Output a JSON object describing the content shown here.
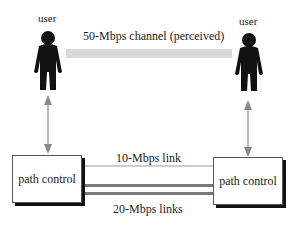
{
  "diagram": {
    "users": [
      {
        "label": "user"
      },
      {
        "label": "user"
      }
    ],
    "perceived_channel": {
      "label": "50-Mbps channel (perceived)",
      "color": "#d9d9d9"
    },
    "path_controls": [
      {
        "label": "path control"
      },
      {
        "label": "path control"
      }
    ],
    "links": {
      "thin": {
        "label": "10-Mbps link",
        "color": "#999999"
      },
      "thick": {
        "label": "20-Mbps links",
        "color": "#7a7a7a",
        "count": 2
      }
    },
    "arrow_color": "#8a8a8a"
  }
}
